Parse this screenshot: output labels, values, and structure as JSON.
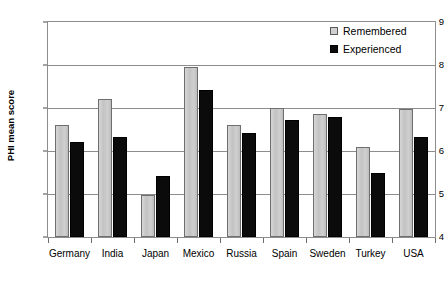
{
  "chart_data": {
    "type": "bar",
    "title": "",
    "xlabel": "",
    "ylabel": "PHI mean score",
    "ylim": [
      4,
      9
    ],
    "yticks": [
      4,
      5,
      6,
      7,
      8,
      9
    ],
    "ytick_labels": [
      "4",
      "5",
      "6",
      "7",
      "8",
      "9"
    ],
    "grid": true,
    "legend_position": "top-right",
    "categories": [
      "Germany",
      "India",
      "Japan",
      "Mexico",
      "Russia",
      "Spain",
      "Sweden",
      "Turkey",
      "USA"
    ],
    "series": [
      {
        "name": "Remembered",
        "color": "#cccccc",
        "values": [
          6.6,
          7.2,
          4.97,
          7.96,
          6.6,
          7.0,
          6.85,
          6.1,
          6.97
        ]
      },
      {
        "name": "Experienced",
        "color": "#0b0b0b",
        "values": [
          6.2,
          6.33,
          5.42,
          7.42,
          6.42,
          6.72,
          6.78,
          5.5,
          6.32
        ]
      }
    ]
  },
  "legend": {
    "items": [
      {
        "label": "Remembered",
        "swatch": "remembered"
      },
      {
        "label": "Experienced",
        "swatch": "experienced"
      }
    ]
  }
}
